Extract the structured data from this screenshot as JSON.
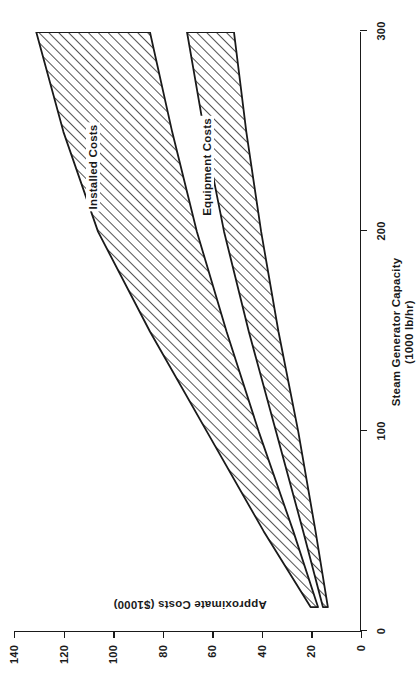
{
  "chart_data": {
    "type": "area",
    "title": "",
    "subtitle": "",
    "xlabel_line1": "Steam Generator Capacity",
    "xlabel_line2": "(1000 lb/hr)",
    "ylabel": "Approximate Costs ($1000)",
    "xlim": [
      0,
      300
    ],
    "ylim": [
      0,
      140
    ],
    "xticks": [
      0,
      100,
      200,
      300
    ],
    "xtick_labels": [
      "0",
      "100",
      "200",
      "300"
    ],
    "yticks": [
      0,
      20,
      40,
      60,
      80,
      100,
      120,
      140
    ],
    "ytick_labels": [
      "0",
      "20",
      "40",
      "60",
      "80",
      "100",
      "120",
      "140"
    ],
    "grid": false,
    "legend_position": "inline-annotation",
    "x_unit": "1000 lb/hr",
    "y_unit": "$1000",
    "series": [
      {
        "name": "Installed Costs",
        "kind": "band",
        "hatch": "diagonal",
        "x": [
          12,
          50,
          100,
          150,
          200,
          250,
          300
        ],
        "upper": [
          20,
          39,
          62,
          85,
          106,
          120,
          131
        ],
        "lower": [
          17,
          27,
          41,
          54,
          66,
          76,
          85
        ]
      },
      {
        "name": "Equipment Costs",
        "kind": "band",
        "hatch": "diagonal",
        "x": [
          12,
          50,
          100,
          150,
          200,
          250,
          300
        ],
        "upper": [
          15,
          23,
          34,
          45,
          55,
          63,
          70
        ],
        "lower": [
          13,
          18,
          25,
          33,
          40,
          46,
          51
        ]
      }
    ],
    "annotations": [
      {
        "text": "Installed Costs",
        "x": 232,
        "y": 108
      },
      {
        "text": "Equipment Costs",
        "x": 232,
        "y": 62
      }
    ],
    "colors": {
      "axis": "#1a1a1a",
      "hatch": "#1a1a1a",
      "background": "#ffffff"
    }
  }
}
